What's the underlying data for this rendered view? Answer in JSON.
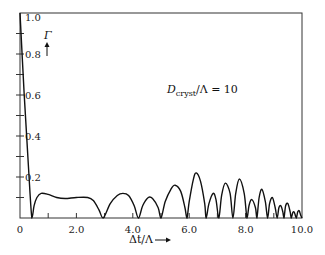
{
  "chart_data": {
    "type": "line",
    "title": "",
    "xlabel": "Δt/Λ",
    "ylabel": "Γ",
    "xlim": [
      0,
      10
    ],
    "ylim": [
      0,
      1.0
    ],
    "grid": false,
    "x_ticks": [
      0,
      2.0,
      4.0,
      6.0,
      8.0,
      10.0
    ],
    "x_tick_labels": [
      "0",
      "2.0",
      "4.0",
      "6.0",
      "8.0",
      "10.0"
    ],
    "x_minor_ticks": [
      1.0,
      3.0,
      5.0,
      7.0,
      9.0
    ],
    "y_ticks": [
      0.1,
      0.2,
      0.3,
      0.4,
      0.5,
      0.6,
      0.7,
      0.8,
      0.9
    ],
    "y_tick_labels": [
      {
        "value": 0.2,
        "label": "0.2"
      },
      {
        "value": 0.4,
        "label": "0.4"
      },
      {
        "value": 0.6,
        "label": "0.6"
      },
      {
        "value": 0.8,
        "label": "0.8"
      },
      {
        "value": 1.0,
        "label": "1.0"
      }
    ],
    "annotation": {
      "prefix": "D",
      "subscript": "cryst",
      "suffix": "/Λ = 10"
    },
    "series": [
      {
        "name": "Gamma",
        "points": [
          [
            0.0,
            1.0
          ],
          [
            0.15,
            0.6
          ],
          [
            0.3,
            0.25
          ],
          [
            0.42,
            0.0
          ],
          [
            0.5,
            0.06
          ],
          [
            0.6,
            0.1
          ],
          [
            0.75,
            0.12
          ],
          [
            1.0,
            0.115
          ],
          [
            1.3,
            0.1
          ],
          [
            1.6,
            0.095
          ],
          [
            2.0,
            0.1
          ],
          [
            2.4,
            0.1
          ],
          [
            2.6,
            0.085
          ],
          [
            2.8,
            0.04
          ],
          [
            2.95,
            0.0
          ],
          [
            3.2,
            0.07
          ],
          [
            3.45,
            0.11
          ],
          [
            3.65,
            0.12
          ],
          [
            3.85,
            0.11
          ],
          [
            4.05,
            0.06
          ],
          [
            4.2,
            0.0
          ],
          [
            4.35,
            0.06
          ],
          [
            4.55,
            0.1
          ],
          [
            4.7,
            0.095
          ],
          [
            4.9,
            0.05
          ],
          [
            5.0,
            0.0
          ],
          [
            5.15,
            0.08
          ],
          [
            5.35,
            0.14
          ],
          [
            5.5,
            0.16
          ],
          [
            5.7,
            0.13
          ],
          [
            5.85,
            0.05
          ],
          [
            5.92,
            0.0
          ],
          [
            6.0,
            0.08
          ],
          [
            6.15,
            0.19
          ],
          [
            6.25,
            0.22
          ],
          [
            6.4,
            0.18
          ],
          [
            6.55,
            0.07
          ],
          [
            6.6,
            0.0
          ],
          [
            6.7,
            0.07
          ],
          [
            6.85,
            0.12
          ],
          [
            6.95,
            0.09
          ],
          [
            7.05,
            0.0
          ],
          [
            7.15,
            0.11
          ],
          [
            7.28,
            0.17
          ],
          [
            7.45,
            0.12
          ],
          [
            7.55,
            0.0
          ],
          [
            7.65,
            0.12
          ],
          [
            7.78,
            0.19
          ],
          [
            7.95,
            0.12
          ],
          [
            8.05,
            0.0
          ],
          [
            8.12,
            0.06
          ],
          [
            8.22,
            0.09
          ],
          [
            8.35,
            0.05
          ],
          [
            8.4,
            0.0
          ],
          [
            8.48,
            0.1
          ],
          [
            8.58,
            0.14
          ],
          [
            8.7,
            0.08
          ],
          [
            8.78,
            0.0
          ],
          [
            8.85,
            0.07
          ],
          [
            8.95,
            0.1
          ],
          [
            9.05,
            0.05
          ],
          [
            9.12,
            0.0
          ],
          [
            9.18,
            0.05
          ],
          [
            9.25,
            0.06
          ],
          [
            9.32,
            0.03
          ],
          [
            9.36,
            0.0
          ],
          [
            9.42,
            0.06
          ],
          [
            9.5,
            0.07
          ],
          [
            9.58,
            0.03
          ],
          [
            9.62,
            0.0
          ],
          [
            9.67,
            0.025
          ],
          [
            9.72,
            0.03
          ],
          [
            9.77,
            0.01
          ],
          [
            9.8,
            0.0
          ],
          [
            9.85,
            0.03
          ],
          [
            9.9,
            0.035
          ],
          [
            9.95,
            0.015
          ],
          [
            10.0,
            0.0
          ]
        ]
      }
    ]
  }
}
